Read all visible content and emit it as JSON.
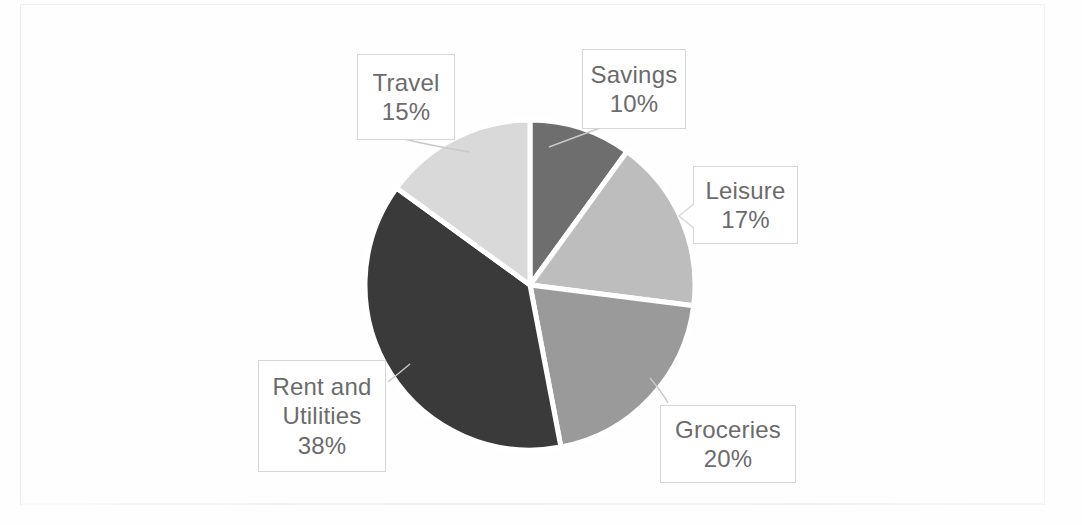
{
  "chart_data": {
    "type": "pie",
    "title": "",
    "categories": [
      "Savings",
      "Leisure",
      "Groceries",
      "Rent and Utilities",
      "Travel"
    ],
    "values": [
      10,
      17,
      20,
      38,
      15
    ],
    "value_unit": "%",
    "start_angle_deg": 0,
    "direction": "clockwise",
    "legend": "none",
    "labels_position": "callout-boxes-outside",
    "slices": [
      {
        "name": "Savings",
        "value": 10,
        "label_value": "10%",
        "color": "#6e6e6e"
      },
      {
        "name": "Leisure",
        "value": 17,
        "label_value": "17%",
        "color": "#bdbdbd"
      },
      {
        "name": "Groceries",
        "value": 20,
        "label_value": "20%",
        "color": "#9a9a9a"
      },
      {
        "name": "Rent and Utilities",
        "value": 38,
        "label_value": "38%",
        "color": "#3a3a3a"
      },
      {
        "name": "Travel",
        "value": 15,
        "label_value": "15%",
        "color": "#d9d9d9"
      }
    ]
  },
  "callouts": {
    "travel": {
      "name": "Travel",
      "value": "15%"
    },
    "savings": {
      "name": "Savings",
      "value": "10%"
    },
    "leisure": {
      "name": "Leisure",
      "value": "17%"
    },
    "groceries": {
      "name": "Groceries",
      "value": "20%"
    },
    "rent": {
      "name_line1": "Rent and",
      "name_line2": "Utilities",
      "value": "38%"
    }
  },
  "colors": {
    "background": "#ffffff",
    "slice_separator": "#ffffff",
    "callout_border": "#d6d6d6",
    "callout_text": "#6b6b6b",
    "leader_line": "#c9c9c9",
    "page_frame": "#f1f1f1"
  }
}
